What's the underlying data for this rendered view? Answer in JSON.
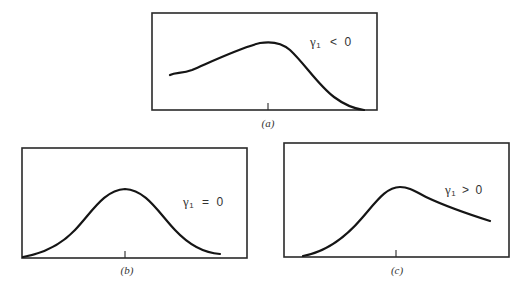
{
  "figure": {
    "panels": [
      {
        "id": "a",
        "caption": "(a)",
        "gamma_symbol": "γ",
        "gamma_subscript": "1",
        "relation": "<",
        "value": "0",
        "shape": "negatively skewed (long left tail)"
      },
      {
        "id": "b",
        "caption": "(b)",
        "gamma_symbol": "γ",
        "gamma_subscript": "1",
        "relation": "=",
        "value": "0",
        "shape": "symmetric bell curve"
      },
      {
        "id": "c",
        "caption": "(c)",
        "gamma_symbol": "γ",
        "gamma_subscript": "1",
        "relation": ">",
        "value": "0",
        "shape": "positively skewed (long right tail)"
      }
    ],
    "colors": {
      "line": "#151515",
      "frame": "#2a2a2a",
      "text": "#333333",
      "background": "#ffffff"
    }
  }
}
